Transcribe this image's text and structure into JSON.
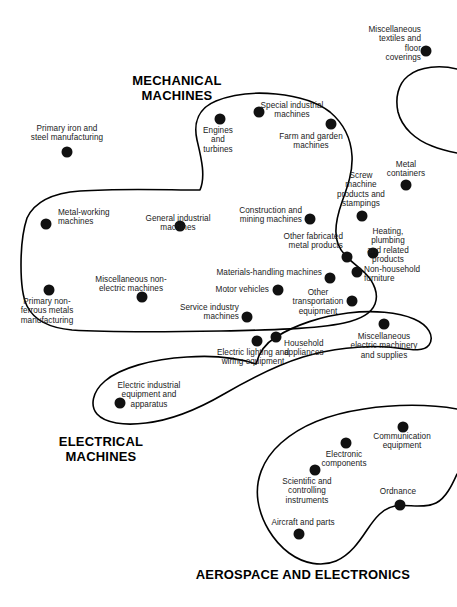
{
  "figure": {
    "title": "",
    "background_color": "#ffffff",
    "node_color": "#111111",
    "outline_color": "#000000",
    "width": 457,
    "height": 607
  },
  "group_headings": [
    {
      "text": "MECHANICAL\nMACHINES",
      "x": 177,
      "y": 74
    },
    {
      "text": "ELECTRICAL\nMACHINES",
      "x": 101,
      "y": 435
    },
    {
      "text": "AEROSPACE AND ELECTRONICS",
      "x": 303,
      "y": 568
    }
  ],
  "clusters": [
    {
      "name": "mechanical-machines",
      "heading": "MECHANICAL MACHINES"
    },
    {
      "name": "electrical-machines",
      "heading": "ELECTRICAL MACHINES"
    },
    {
      "name": "aerospace-and-electronics",
      "heading": "AEROSPACE AND ELECTRONICS"
    },
    {
      "name": "miscellaneous-textiles",
      "heading": ""
    }
  ],
  "nodes": [
    {
      "label": "Miscellaneous\ntextiles and\nfloor\ncoverings",
      "x": 426,
      "y": 51,
      "lx": 421,
      "ly": 25,
      "align": "right",
      "cluster": "miscellaneous-textiles"
    },
    {
      "label": "Primary iron and\nsteel manufacturing",
      "x": 67,
      "y": 152,
      "lx": 67,
      "ly": 124,
      "align": "center",
      "cluster": "none"
    },
    {
      "label": "Engines\nand\nturbines",
      "x": 220,
      "y": 119,
      "lx": 218,
      "ly": 126,
      "align": "center",
      "cluster": "mechanical-machines"
    },
    {
      "label": "Special industrial\nmachines",
      "x": 259,
      "y": 112,
      "lx": 292,
      "ly": 101,
      "align": "center",
      "cluster": "mechanical-machines"
    },
    {
      "label": "Farm and garden\nmachines",
      "x": 331,
      "y": 124,
      "lx": 311,
      "ly": 132,
      "align": "center",
      "cluster": "mechanical-machines"
    },
    {
      "label": "Metal\ncontainers",
      "x": 406,
      "y": 185,
      "lx": 406,
      "ly": 160,
      "align": "center",
      "cluster": "none"
    },
    {
      "label": "Screw\nmachine\nproducts and\nstampings",
      "x": 362,
      "y": 216,
      "lx": 361,
      "ly": 171,
      "align": "center",
      "cluster": "none"
    },
    {
      "label": "Metal-working\nmachines",
      "x": 46,
      "y": 224,
      "lx": 58,
      "ly": 208,
      "align": "left",
      "cluster": "mechanical-machines"
    },
    {
      "label": "General industrial\nmachines",
      "x": 180,
      "y": 226,
      "lx": 178,
      "ly": 214,
      "align": "center",
      "cluster": "mechanical-machines"
    },
    {
      "label": "Construction and\nmining machines",
      "x": 310,
      "y": 219,
      "lx": 302,
      "ly": 206,
      "align": "right",
      "cluster": "mechanical-machines"
    },
    {
      "label": "Heating,\nplumbing\nand related\nproducts",
      "x": 373,
      "y": 253,
      "lx": 388,
      "ly": 227,
      "align": "center",
      "cluster": "none"
    },
    {
      "label": "Other fabricated\nmetal products",
      "x": 347,
      "y": 257,
      "lx": 343,
      "ly": 232,
      "align": "right",
      "cluster": "none"
    },
    {
      "label": "Non-household\nfurniture",
      "x": 357,
      "y": 272,
      "lx": 364,
      "ly": 265,
      "align": "left",
      "cluster": "none"
    },
    {
      "label": "Miscellaneous non-\nelectric machines",
      "x": 142,
      "y": 297,
      "lx": 131,
      "ly": 275,
      "align": "center",
      "cluster": "mechanical-machines"
    },
    {
      "label": "Materials-handling machines",
      "x": 330,
      "y": 278,
      "lx": 322,
      "ly": 268,
      "align": "right",
      "cluster": "mechanical-machines"
    },
    {
      "label": "Motor vehicles",
      "x": 278,
      "y": 290,
      "lx": 269,
      "ly": 285,
      "align": "right",
      "cluster": "mechanical-machines"
    },
    {
      "label": "Other\ntransportation\nequipment",
      "x": 352,
      "y": 301,
      "lx": 318,
      "ly": 288,
      "align": "center",
      "cluster": "mechanical-machines"
    },
    {
      "label": "Primary non-\nferrous metals\nmanufacturing",
      "x": 49,
      "y": 290,
      "lx": 47,
      "ly": 297,
      "align": "center",
      "cluster": "none"
    },
    {
      "label": "Service industry\nmachines",
      "x": 247,
      "y": 317,
      "lx": 239,
      "ly": 303,
      "align": "right",
      "cluster": "mechanical-machines"
    },
    {
      "label": "Miscellaneous\nelectric machinery\nand supplies",
      "x": 384,
      "y": 324,
      "lx": 384,
      "ly": 332,
      "align": "center",
      "cluster": "electrical-machines"
    },
    {
      "label": "Household\nappliances",
      "x": 276,
      "y": 337,
      "lx": 284,
      "ly": 339,
      "align": "left",
      "cluster": "electrical-machines"
    },
    {
      "label": "Electric lighting and\nwiring equipment",
      "x": 257,
      "y": 341,
      "lx": 253,
      "ly": 348,
      "align": "center",
      "cluster": "electrical-machines"
    },
    {
      "label": "Electric industrial\nequipment and\napparatus",
      "x": 120,
      "y": 403,
      "lx": 149,
      "ly": 381,
      "align": "center",
      "cluster": "electrical-machines"
    },
    {
      "label": "Communication\nequipment",
      "x": 403,
      "y": 427,
      "lx": 402,
      "ly": 432,
      "align": "center",
      "cluster": "aerospace-and-electronics"
    },
    {
      "label": "Electronic\ncomponents",
      "x": 346,
      "y": 443,
      "lx": 344,
      "ly": 450,
      "align": "center",
      "cluster": "aerospace-and-electronics"
    },
    {
      "label": "Scientific and\ncontrolling\ninstruments",
      "x": 315,
      "y": 470,
      "lx": 307,
      "ly": 477,
      "align": "center",
      "cluster": "aerospace-and-electronics"
    },
    {
      "label": "Ordnance",
      "x": 400,
      "y": 505,
      "lx": 398,
      "ly": 487,
      "align": "center",
      "cluster": "aerospace-and-electronics"
    },
    {
      "label": "Aircraft and parts",
      "x": 299,
      "y": 534,
      "lx": 303,
      "ly": 518,
      "align": "center",
      "cluster": "aerospace-and-electronics"
    }
  ],
  "outlines": [
    {
      "name": "miscellaneous-textiles-outline",
      "d": "M 457 69 C 441 65 420 66 408 76 C 398 84 395 98 398 112 C 402 128 416 140 432 146 C 442 150 452 152 457 153"
    },
    {
      "name": "mechanical-machines-outline",
      "d": "M 27 218 C 34 203 52 193 80 191 C 120 188 168 190 200 190 C 206 176 201 157 197 140 C 193 122 199 108 216 101 C 233 94 256 92 276 94 C 296 96 316 101 330 112 C 343 123 351 138 352 156 C 353 172 347 188 342 202 C 337 216 333 231 338 244 C 343 257 356 264 365 273 C 374 282 379 294 375 304 C 371 314 358 320 344 323 C 316 329 270 330 221 331 C 160 332 103 332 72 330 C 50 328 34 320 27 306 C 19 290 19 242 27 218 Z"
    },
    {
      "name": "electrical-machines-outline",
      "d": "M 256 364 C 238 358 214 355 187 357 C 152 359 120 368 105 381 C 92 392 90 406 97 414 C 105 423 124 426 146 423 C 172 420 200 408 224 394 C 248 380 274 366 303 357 C 330 349 363 345 388 347 C 408 349 423 353 429 345 C 435 336 428 325 414 319 C 398 312 373 310 348 313 C 322 316 295 325 276 337 C 263 345 258 356 256 364 Z"
    },
    {
      "name": "aerospace-outline",
      "d": "M 457 409 C 430 404 395 404 364 409 C 330 414 300 426 281 443 C 262 460 255 481 258 501 C 261 521 273 541 289 553 C 304 564 322 567 336 561 C 350 555 359 542 367 530 C 375 518 383 508 395 506 C 408 504 424 509 436 503 C 446 498 452 485 457 474"
    }
  ]
}
